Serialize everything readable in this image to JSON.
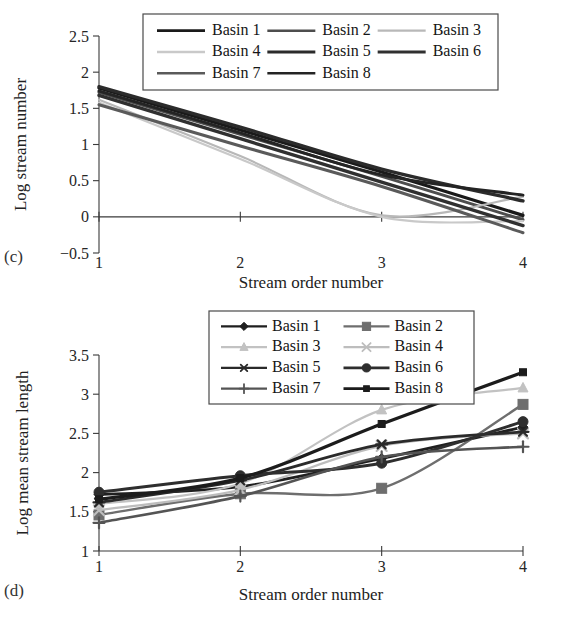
{
  "figure": {
    "panels": [
      {
        "tag": "(c)",
        "chart_ref": 0
      },
      {
        "tag": "(d)",
        "chart_ref": 1
      }
    ]
  },
  "chart_data": [
    {
      "type": "line",
      "panel": "(c)",
      "title": "",
      "xlabel": "Stream order number",
      "ylabel": "Log stream number",
      "x": [
        1,
        2,
        3,
        4
      ],
      "xticks": [
        "1",
        "2",
        "3",
        "4"
      ],
      "yticks": [
        "-0.5",
        "0",
        "0.5",
        "1",
        "1.5",
        "2",
        "2.5"
      ],
      "xlim": [
        1,
        4
      ],
      "ylim": [
        -0.5,
        2.5
      ],
      "grid": false,
      "legend_position": "top-center",
      "legend_cols": 3,
      "series": [
        {
          "name": "Basin 1",
          "values": [
            1.78,
            1.2,
            0.62,
            0.02
          ],
          "color": "#1a1a1a",
          "width": 3.2
        },
        {
          "name": "Basin 2",
          "values": [
            1.72,
            1.14,
            0.56,
            -0.04
          ],
          "color": "#4d4d4d",
          "width": 3.0
        },
        {
          "name": "Basin 3",
          "values": [
            1.62,
            0.84,
            0.02,
            0.28
          ],
          "color": "#b8b8b8",
          "width": 2.2
        },
        {
          "name": "Basin 4",
          "values": [
            1.58,
            0.8,
            0.0,
            -0.06
          ],
          "color": "#c9c9c9",
          "width": 2.2
        },
        {
          "name": "Basin 5",
          "values": [
            1.8,
            1.24,
            0.66,
            0.22
          ],
          "color": "#2b2b2b",
          "width": 3.4
        },
        {
          "name": "Basin 6",
          "values": [
            1.68,
            1.08,
            0.48,
            -0.12
          ],
          "color": "#303030",
          "width": 3.4
        },
        {
          "name": "Basin 7",
          "values": [
            1.55,
            0.98,
            0.42,
            -0.22
          ],
          "color": "#5a5a5a",
          "width": 3.0
        },
        {
          "name": "Basin 8",
          "values": [
            1.74,
            1.16,
            0.58,
            0.3
          ],
          "color": "#242424",
          "width": 3.0
        }
      ]
    },
    {
      "type": "line",
      "panel": "(d)",
      "title": "",
      "xlabel": "Stream order number",
      "ylabel": "Log mean stream length",
      "x": [
        1,
        2,
        3,
        4
      ],
      "xticks": [
        "1",
        "2",
        "3",
        "4"
      ],
      "yticks": [
        "1",
        "1.5",
        "2",
        "2.5",
        "3",
        "3.5"
      ],
      "xlim": [
        1,
        4
      ],
      "ylim": [
        1,
        3.5
      ],
      "grid": false,
      "legend_position": "top-center",
      "legend_cols": 2,
      "series": [
        {
          "name": "Basin 1",
          "values": [
            1.72,
            1.82,
            2.18,
            2.58
          ],
          "color": "#1f1f1f",
          "width": 2.8,
          "marker": "diamond"
        },
        {
          "name": "Basin 2",
          "values": [
            1.46,
            1.73,
            1.8,
            2.87
          ],
          "color": "#6e6e6e",
          "width": 2.4,
          "marker": "square"
        },
        {
          "name": "Basin 3",
          "values": [
            1.6,
            1.86,
            2.8,
            3.08
          ],
          "color": "#c2c2c2",
          "width": 2.2,
          "marker": "triangle"
        },
        {
          "name": "Basin 4",
          "values": [
            1.52,
            1.78,
            2.34,
            2.5
          ],
          "color": "#bdbdbd",
          "width": 2.2,
          "marker": "cross"
        },
        {
          "name": "Basin 5",
          "values": [
            1.62,
            1.9,
            2.36,
            2.52
          ],
          "color": "#2a2a2a",
          "width": 2.8,
          "marker": "star"
        },
        {
          "name": "Basin 6",
          "values": [
            1.75,
            1.96,
            2.12,
            2.65
          ],
          "color": "#2e2e2e",
          "width": 3.0,
          "marker": "circle"
        },
        {
          "name": "Basin 7",
          "values": [
            1.36,
            1.7,
            2.2,
            2.33
          ],
          "color": "#545454",
          "width": 2.6,
          "marker": "plus"
        },
        {
          "name": "Basin 8",
          "values": [
            1.66,
            1.93,
            2.62,
            3.28
          ],
          "color": "#1c1c1c",
          "width": 3.2,
          "marker": "small-square"
        }
      ]
    }
  ]
}
